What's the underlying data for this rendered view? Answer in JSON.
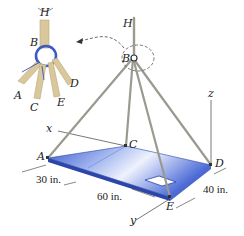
{
  "figure": {
    "inset": {
      "labels": {
        "H": "H",
        "B": "B",
        "A": "A",
        "C": "C",
        "D": "D",
        "E": "E"
      }
    },
    "main": {
      "points": {
        "H": "H",
        "B": "B",
        "A": "A",
        "C": "C",
        "D": "D",
        "E": "E"
      },
      "axes": {
        "x": "x",
        "y": "y",
        "z": "z"
      },
      "dimensions": {
        "d1": "30 in.",
        "d2": "60 in.",
        "d3": "40 in."
      }
    },
    "colors": {
      "plate_top_light": "#e8eefc",
      "plate_top_dark": "#3d5fcf",
      "plate_edge": "#2b45a8",
      "cable": "#9a9a90",
      "rope": "#d8c89c",
      "ring": "#3a5bc4"
    }
  }
}
